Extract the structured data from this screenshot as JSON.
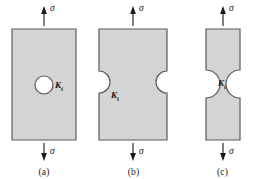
{
  "figure": {
    "type": "engineering-diagram",
    "background_color": "#ffffff",
    "body_fill_color": "#d4d4d4",
    "body_stroke_color": "#5a5a5a",
    "hole_fill_color": "#ffffff",
    "arrow_color": "#1a1a1a",
    "stress_symbol": "σ",
    "kt_symbol": "K",
    "kt_subscript": "t",
    "panels": [
      {
        "id": "a",
        "caption": "(a)",
        "feature": "central circular hole",
        "top_stress_label": "σ",
        "bottom_stress_label": "σ",
        "kt_label": "K",
        "kt_sub": "t",
        "left": 0,
        "width": 88,
        "body_x": 12,
        "body_y": 29,
        "body_w": 64,
        "body_h": 111,
        "hole_cx": 44,
        "hole_cy": 85,
        "hole_r": 9
      },
      {
        "id": "b",
        "caption": "(b)",
        "feature": "two opposite semicircular edge notches",
        "top_stress_label": "σ",
        "bottom_stress_label": "σ",
        "kt_label": "K",
        "kt_sub": "t",
        "left": 89,
        "width": 89,
        "body_x": 10,
        "body_y": 29,
        "body_w": 68,
        "body_h": 111,
        "notch_cy": 82,
        "notch_r": 11
      },
      {
        "id": "c",
        "caption": "(c)",
        "feature": "deep opposing notches forming narrow neck",
        "top_stress_label": "σ",
        "bottom_stress_label": "σ",
        "kt_label": "K",
        "kt_sub": "t",
        "left": 178,
        "width": 89,
        "body_x": 28,
        "body_y": 29,
        "body_w": 34,
        "body_h": 111,
        "notch_cy": 84,
        "notch_r": 14
      }
    ],
    "arrows": {
      "top": {
        "direction": "up",
        "y_start": 26,
        "y_end": 8,
        "label_offset_x": 6,
        "label_offset_y": 5
      },
      "bottom": {
        "direction": "down",
        "y_start": 143,
        "y_end": 161,
        "label_offset_x": 6,
        "label_offset_y": 5
      }
    }
  }
}
